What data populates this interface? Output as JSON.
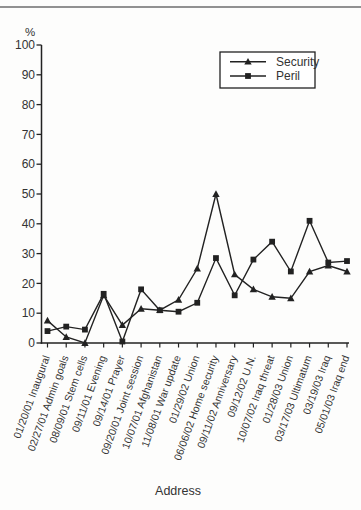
{
  "figure": {
    "background": "#fdfdfc",
    "top_rule_color": "#919191",
    "text_color": "#333333",
    "line_color": "#222222"
  },
  "chart_data": {
    "type": "line",
    "title": "",
    "xlabel": "Address",
    "ylabel": "%",
    "ylim": [
      0,
      100
    ],
    "ytick_interval": 10,
    "yticks": [
      0,
      10,
      20,
      30,
      40,
      50,
      60,
      70,
      80,
      90,
      100
    ],
    "grid": false,
    "legend_position": "top-right",
    "categories": [
      "01/20/01 Inaugural",
      "02/27/01 Admin goals",
      "08/09/01 Stem cells",
      "09/11/01 Evening",
      "09/14/01 Prayer",
      "09/20/01 Joint session",
      "10/07/01 Afghanistan",
      "11/08/01 War update",
      "01/29/02 Union",
      "06/06/02 Home security",
      "09/11/02 Anniversary",
      "09/12/02 U.N.",
      "10/07/02 Iraq threat",
      "01/28/03 Union",
      "03/17/03 Ultimatum",
      "03/19/03 Iraq",
      "05/01/03 Iraq end"
    ],
    "series": [
      {
        "name": "Security",
        "marker": "triangle",
        "color": "#222222",
        "values": [
          7.5,
          2,
          0,
          16,
          6,
          11.5,
          11,
          14.5,
          25,
          50,
          23,
          18,
          15.5,
          15,
          24,
          26,
          24
        ]
      },
      {
        "name": "Peril",
        "marker": "square",
        "color": "#222222",
        "values": [
          4,
          5.5,
          4.5,
          16.5,
          0.5,
          18,
          11,
          10.5,
          13.5,
          28.5,
          16,
          28,
          34,
          24,
          41,
          27,
          27.5
        ]
      }
    ]
  }
}
